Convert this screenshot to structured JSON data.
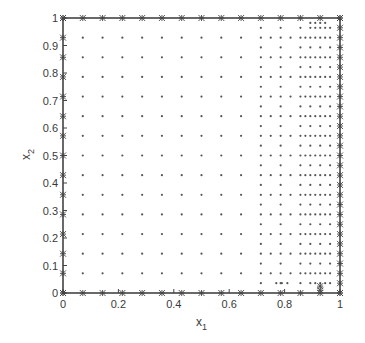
{
  "chart_data": {
    "type": "scatter",
    "title": "",
    "xlabel": "x_1",
    "ylabel": "x_2",
    "xlabel_main": "x",
    "xlabel_sub": "1",
    "ylabel_main": "x",
    "ylabel_sub": "2",
    "xlim": [
      0,
      1
    ],
    "ylim": [
      0,
      1
    ],
    "grid": false,
    "legend": null,
    "x_ticks": [
      0,
      0.2,
      0.4,
      0.6,
      0.8,
      1
    ],
    "x_tick_labels": [
      "0",
      "0.2",
      "0.4",
      "0.6",
      "0.8",
      "1"
    ],
    "y_ticks": [
      0,
      0.1,
      0.2,
      0.3,
      0.4,
      0.5,
      0.6,
      0.7,
      0.8,
      0.9,
      1
    ],
    "y_tick_labels": [
      "0",
      "0.1",
      "0.2",
      "0.3",
      "0.4",
      "0.5",
      "0.6",
      "0.7",
      "0.8",
      "0.9",
      "1"
    ],
    "series": [
      {
        "name": "interior-coarse",
        "marker": "dot",
        "grid_spacing": 0.0714,
        "x_range": [
          0.0714,
          0.9286
        ],
        "y_range": [
          0.0714,
          0.9286
        ]
      },
      {
        "name": "interior-refined",
        "marker": "dot",
        "refined_x_columns": [
          0.7143,
          0.7857,
          0.8214,
          0.8571,
          0.875,
          0.8929,
          0.9107,
          0.9286,
          0.9464,
          0.9643
        ],
        "refined_y_spacing": [
          0.0357,
          0.0179
        ]
      },
      {
        "name": "boundary",
        "marker": "star",
        "edges": [
          "x1=0",
          "x1=1",
          "x2=0",
          "x2=1"
        ],
        "spacing": 0.0714
      }
    ],
    "colors": {
      "axis": "#444444",
      "points": "#555555",
      "background": "#ffffff"
    }
  }
}
